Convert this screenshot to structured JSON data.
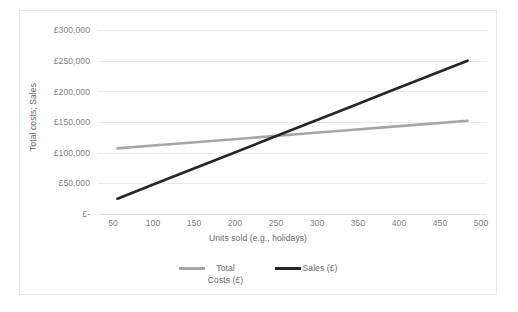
{
  "chart_data": {
    "type": "line",
    "title": "",
    "xlabel": "Units sold (e.g., holidays)",
    "ylabel": "Total costs; Sales",
    "x": [
      50,
      100,
      150,
      200,
      250,
      300,
      350,
      400,
      450,
      500
    ],
    "xlim": [
      25,
      525
    ],
    "ylim": [
      0,
      300000
    ],
    "ytick_labels": [
      "£300,000",
      "£250,000",
      "£200,000",
      "£150,000",
      "£100,000",
      "£50,000",
      "£-"
    ],
    "ytick_values": [
      300000,
      250000,
      200000,
      150000,
      100000,
      50000,
      0
    ],
    "xtick_labels": [
      "50",
      "100",
      "150",
      "200",
      "250",
      "300",
      "350",
      "400",
      "450",
      "500"
    ],
    "grid": true,
    "legend_position": "bottom",
    "series": [
      {
        "name": "Total Costs (£)",
        "color": "#a6a6a6",
        "values": [
          107000,
          112000,
          117000,
          122000,
          127000,
          132000,
          137000,
          142000,
          147000,
          152000
        ]
      },
      {
        "name": "Sales (£)",
        "color": "#262626",
        "values": [
          25000,
          50000,
          75000,
          100000,
          125000,
          150000,
          175000,
          200000,
          225000,
          250000
        ]
      }
    ]
  },
  "chart": {
    "y_axis_title": "Total costs; Sales",
    "x_axis_title": "Units sold (e.g., holidays)",
    "y_ticks": [
      "£300,000",
      "£250,000",
      "£200,000",
      "£150,000",
      "£100,000",
      "£50,000",
      "£-"
    ],
    "x_ticks": [
      "50",
      "100",
      "150",
      "200",
      "250",
      "300",
      "350",
      "400",
      "450",
      "500"
    ]
  },
  "legend": {
    "items": [
      {
        "label": "Total Costs (£)",
        "color": "#a6a6a6"
      },
      {
        "label": "Sales (£)",
        "color": "#262626"
      }
    ]
  },
  "footer": {
    "caption_sliver": ""
  }
}
